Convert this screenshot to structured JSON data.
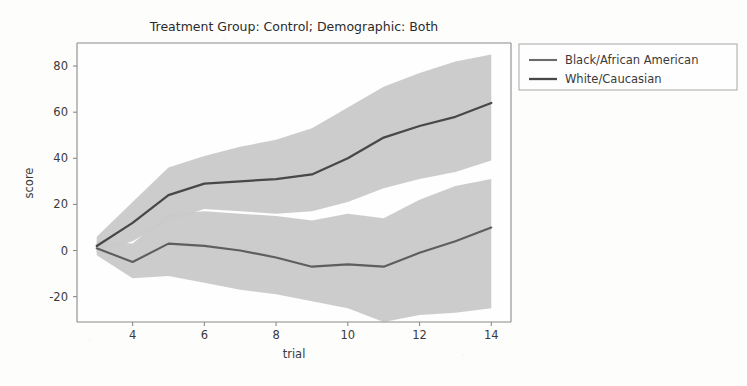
{
  "chart_data": {
    "type": "line",
    "title": "Treatment Group: Control; Demographic: Both",
    "xlabel": "trial",
    "ylabel": "score",
    "xlim": [
      2.45,
      14.55
    ],
    "ylim": [
      -31,
      90
    ],
    "xticks": [
      4,
      6,
      8,
      10,
      12,
      14
    ],
    "yticks": [
      -20,
      0,
      20,
      40,
      60,
      80
    ],
    "grid": false,
    "legend_position": "outside-top-right",
    "x": [
      3,
      4,
      5,
      6,
      7,
      8,
      9,
      10,
      11,
      12,
      13,
      14
    ],
    "series": [
      {
        "name": "Black/African American",
        "color": "#555555",
        "values": [
          1,
          -5,
          3,
          2,
          0,
          -3,
          -7,
          -6,
          -7,
          -1,
          4,
          10
        ],
        "band_lower": [
          -2,
          -12,
          -11,
          -14,
          -17,
          -19,
          -22,
          -25,
          -31,
          -28,
          -27,
          -25
        ],
        "band_upper": [
          4,
          3,
          16,
          17,
          16,
          15,
          13,
          16,
          14,
          22,
          28,
          31
        ]
      },
      {
        "name": "White/Caucasian",
        "color": "#4a4a4a",
        "values": [
          2,
          12,
          24,
          29,
          30,
          31,
          33,
          40,
          49,
          54,
          58,
          64
        ],
        "band_lower": [
          -1,
          4,
          13,
          18,
          17,
          16,
          17,
          21,
          27,
          31,
          34,
          39
        ],
        "band_upper": [
          6,
          21,
          36,
          41,
          45,
          48,
          53,
          62,
          71,
          77,
          82,
          85
        ]
      }
    ]
  },
  "legend": {
    "entries": [
      {
        "label": "Black/African American"
      },
      {
        "label": "White/Caucasian"
      }
    ]
  },
  "axes": {
    "x_tick_labels": [
      "4",
      "6",
      "8",
      "10",
      "12",
      "14"
    ],
    "y_tick_labels": [
      "80",
      "60",
      "40",
      "20",
      "0",
      "-20"
    ]
  },
  "colors": {
    "band_fill": "#c9c9c9",
    "line_dark": "#4a4a4a",
    "line_light": "#6b6b6b",
    "axis": "#7a7a7a",
    "text": "#3a3a3a",
    "background": "#fdfdfc"
  }
}
